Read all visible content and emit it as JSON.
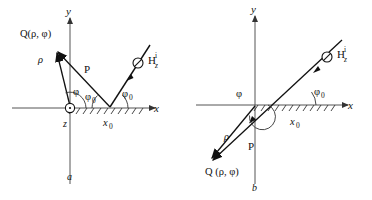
{
  "figure": {
    "type": "diagram",
    "panels": [
      {
        "id": "a",
        "caption": "a",
        "axes": {
          "x_label": "x",
          "y_label": "y",
          "origin_marker": "circled-dot",
          "origin_label": "z"
        },
        "labels": {
          "source_point": "Q(ρ, φ)",
          "rho": "ρ",
          "P": "P",
          "phi": "φ",
          "phi_zero_inner": "φ",
          "phi_zero_inner_sub": "0",
          "phi_zero_outer": "φ",
          "phi_zero_outer_sub": "0",
          "x_zero": "x",
          "x_zero_sub": "0",
          "incident_field": "H",
          "incident_field_sub": "z",
          "incident_field_sup": "i",
          "incident_marker": "circled-slash"
        }
      },
      {
        "id": "b",
        "caption": "b",
        "axes": {
          "x_label": "x",
          "y_label": "y"
        },
        "labels": {
          "source_point": "Q (ρ, φ)",
          "rho": "ρ",
          "P": "P",
          "phi": "φ",
          "phi_zero_outer": "φ",
          "phi_zero_outer_sub": "0",
          "x_zero": "x",
          "x_zero_sub": "0",
          "incident_field": "H",
          "incident_field_sub": "z",
          "incident_field_sup": "i",
          "incident_marker": "circled-slash"
        }
      }
    ],
    "colors": {
      "ink": "#111111",
      "axis": "#555555",
      "background": "#ffffff"
    }
  }
}
